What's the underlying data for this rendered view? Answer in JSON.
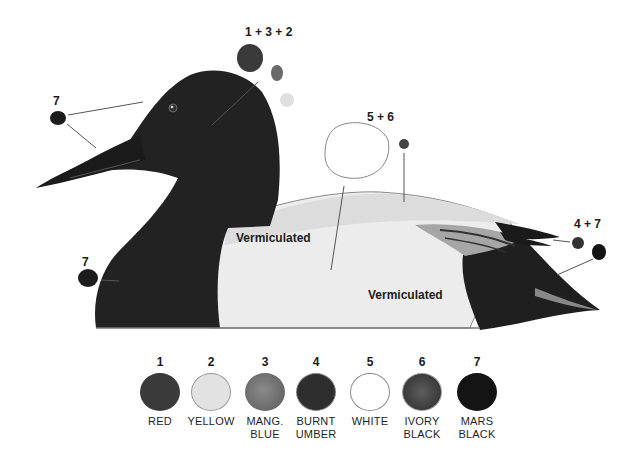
{
  "diagram": {
    "callouts": [
      {
        "id": "head",
        "label": "1 + 3 + 2"
      },
      {
        "id": "back",
        "label": "5 + 6"
      },
      {
        "id": "bill",
        "label": "7"
      },
      {
        "id": "breast",
        "label": "7"
      },
      {
        "id": "tail",
        "label": "4 + 7"
      }
    ],
    "body_labels": [
      {
        "id": "side-front",
        "text": "Vermiculated"
      },
      {
        "id": "side-rear",
        "text": "Vermiculated"
      }
    ]
  },
  "palette": {
    "swatches": [
      {
        "number": "1",
        "name_line1": "RED",
        "name_line2": "",
        "color": "#3a3a3a"
      },
      {
        "number": "2",
        "name_line1": "YELLOW",
        "name_line2": "",
        "color": "#e2e2e2"
      },
      {
        "number": "3",
        "name_line1": "MANG.",
        "name_line2": "BLUE",
        "color": "#6f6f6f"
      },
      {
        "number": "4",
        "name_line1": "BURNT",
        "name_line2": "UMBER",
        "color": "#2e2e2e"
      },
      {
        "number": "5",
        "name_line1": "WHITE",
        "name_line2": "",
        "color": "#ffffff"
      },
      {
        "number": "6",
        "name_line1": "IVORY",
        "name_line2": "BLACK",
        "color": "#4a4a4a"
      },
      {
        "number": "7",
        "name_line1": "MARS",
        "name_line2": "BLACK",
        "color": "#141414"
      }
    ]
  }
}
